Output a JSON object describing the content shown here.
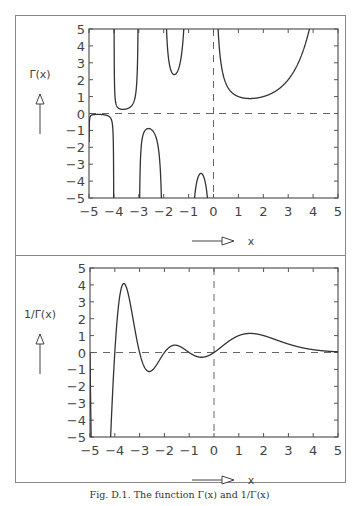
{
  "caption": "Fig. D.1. The function Γ(x) and 1/Γ(x)",
  "colors": {
    "line": "#333333",
    "frame": "#555555",
    "dash": "#666666"
  },
  "chart_data": [
    {
      "type": "line",
      "title": "",
      "xlabel": "x",
      "ylabel": "Γ(x)",
      "xlim": [
        -5,
        5
      ],
      "ylim": [
        -5,
        5
      ],
      "x_ticks": [
        "-5",
        "-4",
        "-3",
        "-2",
        "-1",
        "0",
        "1",
        "2",
        "3",
        "4",
        "5"
      ],
      "y_ticks": [
        "5",
        "4",
        "3",
        "2",
        "1",
        "0",
        "-1",
        "-2",
        "-3",
        "-4",
        "-5"
      ],
      "reference_lines": [
        "y=0 dashed",
        "x=0 dashed"
      ],
      "poles": [
        0,
        -1,
        -2,
        -3,
        -4,
        -5
      ],
      "series": [
        {
          "name": "Γ(x)",
          "function": "gamma",
          "sample_points": [
            [
              -4.5,
              -0.06
            ],
            [
              -3.5,
              0.27
            ],
            [
              -2.5,
              -0.95
            ],
            [
              -1.5,
              2.36
            ],
            [
              -0.5,
              -3.54
            ],
            [
              0.5,
              1.77
            ],
            [
              1.0,
              1.0
            ],
            [
              1.46,
              0.886
            ],
            [
              2.0,
              1.0
            ],
            [
              3.0,
              2.0
            ],
            [
              4.0,
              6.0
            ]
          ]
        }
      ],
      "grid": false
    },
    {
      "type": "line",
      "title": "",
      "xlabel": "x",
      "ylabel": "1/Γ(x)",
      "xlim": [
        -5,
        5
      ],
      "ylim": [
        -5,
        5
      ],
      "x_ticks": [
        "-5",
        "-4",
        "-3",
        "-2",
        "-1",
        "0",
        "1",
        "2",
        "3",
        "4",
        "5"
      ],
      "y_ticks": [
        "5",
        "4",
        "3",
        "2",
        "1",
        "0",
        "-1",
        "-2",
        "-3",
        "-4",
        "-5"
      ],
      "reference_lines": [
        "y=0 dashed",
        "x=0 dashed"
      ],
      "series": [
        {
          "name": "1/Γ(x)",
          "function": "reciprocal_gamma",
          "sample_points": [
            [
              -5.0,
              0
            ],
            [
              -4.0,
              0
            ],
            [
              -3.63,
              4.1
            ],
            [
              -3.0,
              0
            ],
            [
              -2.6,
              -1.1
            ],
            [
              -2.0,
              0
            ],
            [
              -1.57,
              0.45
            ],
            [
              -1.0,
              0
            ],
            [
              -0.5,
              -0.28
            ],
            [
              0.0,
              0
            ],
            [
              1.46,
              1.13
            ],
            [
              2.0,
              1.0
            ],
            [
              3.0,
              0.5
            ],
            [
              4.0,
              0.17
            ],
            [
              5.0,
              0.04
            ]
          ]
        }
      ],
      "grid": false
    }
  ]
}
